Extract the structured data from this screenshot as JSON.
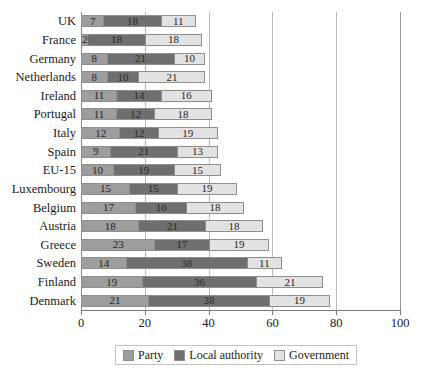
{
  "chart_data": {
    "type": "bar",
    "orientation": "horizontal",
    "stacked": true,
    "title": "",
    "xlabel": "",
    "ylabel": "",
    "xlim": [
      0,
      100
    ],
    "xticks": [
      0,
      20,
      40,
      60,
      80,
      100
    ],
    "grid": true,
    "legend_position": "bottom",
    "categories": [
      "UK",
      "France",
      "Germany",
      "Netherlands",
      "Ireland",
      "Portugal",
      "Italy",
      "Spain",
      "EU-15",
      "Luxembourg",
      "Belgium",
      "Austria",
      "Greece",
      "Sweden",
      "Finland",
      "Denmark"
    ],
    "series": [
      {
        "name": "Party",
        "color": "#9d9d9d",
        "values": [
          7,
          2,
          8,
          8,
          11,
          11,
          12,
          9,
          10,
          15,
          17,
          18,
          23,
          14,
          19,
          21
        ]
      },
      {
        "name": "Local authority",
        "color": "#6f6f6f",
        "values": [
          18,
          18,
          21,
          10,
          14,
          12,
          12,
          21,
          19,
          15,
          16,
          21,
          17,
          38,
          36,
          38
        ]
      },
      {
        "name": "Government",
        "color": "#e2e2e2",
        "values": [
          11,
          18,
          10,
          21,
          16,
          18,
          19,
          13,
          15,
          19,
          18,
          18,
          19,
          11,
          21,
          19
        ]
      }
    ]
  },
  "legend": {
    "items": [
      {
        "label": "Party",
        "key": "party"
      },
      {
        "label": "Local authority",
        "key": "local"
      },
      {
        "label": "Government",
        "key": "government"
      }
    ]
  }
}
